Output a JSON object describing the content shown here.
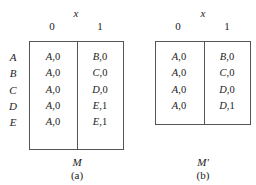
{
  "figures": [
    {
      "id": "a",
      "input_var": "x",
      "columns": [
        "0",
        "1"
      ],
      "rows": [
        {
          "state": "A",
          "cells": [
            {
              "next": "A",
              "out": ",0"
            },
            {
              "next": "B",
              "out": ",0"
            }
          ]
        },
        {
          "state": "B",
          "cells": [
            {
              "next": "A",
              "out": ",0"
            },
            {
              "next": "C",
              "out": ",0"
            }
          ]
        },
        {
          "state": "C",
          "cells": [
            {
              "next": "A",
              "out": ",0"
            },
            {
              "next": "D",
              "out": ",0"
            }
          ]
        },
        {
          "state": "D",
          "cells": [
            {
              "next": "A",
              "out": ",0"
            },
            {
              "next": "E",
              "out": ",1"
            }
          ]
        },
        {
          "state": "E",
          "cells": [
            {
              "next": "A",
              "out": ",0"
            },
            {
              "next": "E",
              "out": ",1"
            }
          ]
        }
      ],
      "machine_name": "M",
      "caption": "(a)"
    },
    {
      "id": "b",
      "input_var": "x",
      "columns": [
        "0",
        "1"
      ],
      "rows": [
        {
          "state": "",
          "cells": [
            {
              "next": "A",
              "out": ",0"
            },
            {
              "next": "B",
              "out": ",0"
            }
          ]
        },
        {
          "state": "",
          "cells": [
            {
              "next": "A",
              "out": ",0"
            },
            {
              "next": "C",
              "out": ",0"
            }
          ]
        },
        {
          "state": "",
          "cells": [
            {
              "next": "A",
              "out": ",0"
            },
            {
              "next": "D",
              "out": ",0"
            }
          ]
        },
        {
          "state": "",
          "cells": [
            {
              "next": "A",
              "out": ",0"
            },
            {
              "next": "D",
              "out": ",1"
            }
          ]
        }
      ],
      "machine_name": "M'",
      "caption": "(b)"
    }
  ]
}
